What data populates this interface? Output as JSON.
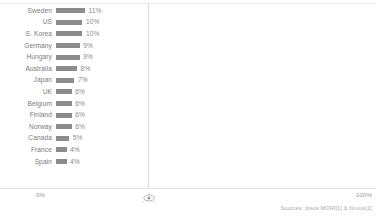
{
  "chart_data": {
    "type": "bar",
    "orientation": "horizontal",
    "title": "",
    "subtitle": "",
    "xlabel": "",
    "ylabel": "",
    "xlim": [
      0,
      100
    ],
    "grid": false,
    "legend": null,
    "categories": [
      "Sweden",
      "US",
      "S. Korea",
      "Germany",
      "Hungary",
      "Australia",
      "Japan",
      "UK",
      "Belgium",
      "Finland",
      "Norway",
      "Canada",
      "France",
      "Spain"
    ],
    "values": [
      11,
      10,
      10,
      9,
      9,
      8,
      7,
      6,
      6,
      6,
      6,
      5,
      4,
      4
    ],
    "value_labels": [
      "11%",
      "10%",
      "10%",
      "9%",
      "9%",
      "8%",
      "7%",
      "6%",
      "6%",
      "6%",
      "6%",
      "5%",
      "4%",
      "4%"
    ],
    "bar_color": "#8c8c8c",
    "axis_ticks": [
      "0%",
      "100%"
    ]
  },
  "axis": {
    "left_label": "0%",
    "right_label": "100%"
  },
  "footer": {
    "source": "Sources: Ipsos MORI[1] & Novus[1]"
  },
  "icons": {
    "axis_marker": "eye-marker-icon"
  }
}
